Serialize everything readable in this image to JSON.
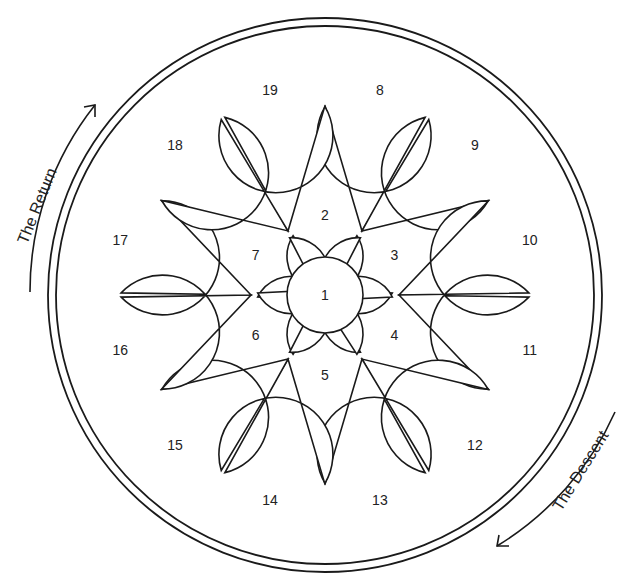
{
  "diagram": {
    "title": "",
    "colors": {
      "stroke": "#1a1a1a",
      "background": "#ffffff",
      "text": "#222222"
    },
    "center": {
      "x": 325,
      "y": 295
    },
    "outer_ring": {
      "outer_radius": 277,
      "inner_radius": 269
    },
    "center_circle": {
      "label": "1",
      "radius": 38
    },
    "inner_petals": [
      {
        "label": "2",
        "angle": -90
      },
      {
        "label": "3",
        "angle": -30
      },
      {
        "label": "4",
        "angle": 30
      },
      {
        "label": "5",
        "angle": 90
      },
      {
        "label": "6",
        "angle": 150
      },
      {
        "label": "7",
        "angle": 210
      }
    ],
    "outer_petals": [
      {
        "label": "8",
        "angle": -75
      },
      {
        "label": "9",
        "angle": -45
      },
      {
        "label": "10",
        "angle": -15
      },
      {
        "label": "11",
        "angle": 15
      },
      {
        "label": "12",
        "angle": 45
      },
      {
        "label": "13",
        "angle": 75
      },
      {
        "label": "14",
        "angle": 105
      },
      {
        "label": "15",
        "angle": 135
      },
      {
        "label": "16",
        "angle": 165
      },
      {
        "label": "17",
        "angle": 195
      },
      {
        "label": "18",
        "angle": 225
      },
      {
        "label": "19",
        "angle": 255
      }
    ],
    "captions": {
      "return": "The Return",
      "descent": "The Descent"
    }
  }
}
